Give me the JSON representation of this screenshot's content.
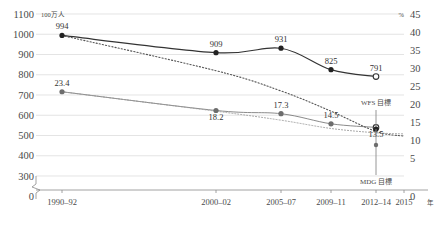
{
  "axes": {
    "left_unit": "100万人",
    "right_unit": "%",
    "x_unit": "年",
    "left_ticks": [
      "1100",
      "1000",
      "900",
      "800",
      "700",
      "600",
      "500",
      "400",
      "300",
      "0"
    ],
    "right_ticks": [
      "45",
      "40",
      "35",
      "30",
      "25",
      "20",
      "15",
      "10",
      "5",
      "0"
    ],
    "x_ticks": [
      "1990–92",
      "2000–02",
      "2005–07",
      "2009–11",
      "2012–14",
      "2015"
    ]
  },
  "annotations": {
    "wfs": "WFS 目標",
    "mdg": "MDG 目標"
  },
  "chart_data": {
    "type": "line",
    "title": "",
    "subtitle": "",
    "xlabel": "年",
    "ylabel": "100万人",
    "y2label": "%",
    "ylim": [
      300,
      1100
    ],
    "y2lim": [
      0,
      45
    ],
    "grid": true,
    "legend": "none",
    "categories": [
      "1990–92",
      "2000–02",
      "2005–07",
      "2009–11",
      "2012–14",
      "2015"
    ],
    "series": [
      {
        "name": "栄養不足人口（100万人）",
        "axis": "left",
        "style": "solid",
        "marker": "filled",
        "values": [
          994,
          909,
          931,
          825,
          791,
          null
        ],
        "labels": [
          "994",
          "909",
          "931",
          "825",
          "791",
          ""
        ],
        "last_marker": "open"
      },
      {
        "name": "栄養不足人口割合（%）",
        "axis": "right",
        "style": "thin",
        "marker": "filled",
        "values": [
          23.4,
          18.2,
          17.3,
          14.5,
          13.5,
          null
        ],
        "labels": [
          "23.4",
          "18.2",
          "17.3",
          "14.5",
          "13.5",
          ""
        ],
        "last_marker": "open"
      },
      {
        "name": "WFS 目標トレンド",
        "axis": "left",
        "style": "dotted",
        "marker": "none",
        "values": [
          994,
          820,
          720,
          620,
          520,
          497
        ],
        "labels": [
          "",
          "",
          "",
          "",
          "",
          ""
        ]
      },
      {
        "name": "MDG 目標トレンド",
        "axis": "right",
        "style": "dotted-light",
        "marker": "none",
        "values": [
          23.4,
          18.0,
          15.5,
          13.2,
          12.0,
          11.7
        ],
        "labels": [
          "",
          "",
          "",
          "",
          "",
          ""
        ]
      }
    ],
    "targets": [
      {
        "name": "WFS 目標",
        "axis": "right",
        "value": 15.0,
        "position": "above"
      },
      {
        "name": "MDG 目標",
        "axis": "right",
        "value": 11.7,
        "position": "below"
      }
    ]
  }
}
